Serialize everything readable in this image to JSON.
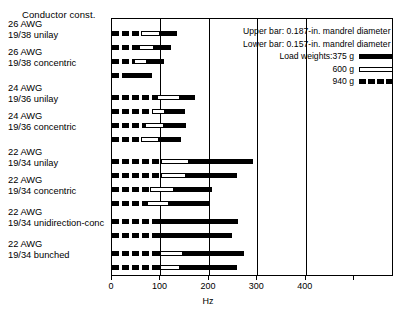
{
  "chart_data": {
    "type": "bar",
    "orientation": "horizontal",
    "stacked": true,
    "title": "",
    "xlabel": "Hz",
    "ylabel": "Conductor const.",
    "xlim": [
      0,
      582
    ],
    "xticks": [
      0,
      100,
      200,
      300,
      400
    ],
    "xticklabels": [
      "0",
      "100",
      "200",
      "300",
      "400"
    ],
    "grid": "vertical gridlines at 100, 200, 300, 400",
    "legend_position": "upper-right inside plot",
    "series": [
      {
        "name": "375 g",
        "style": "solid-black"
      },
      {
        "name": "600 g",
        "style": "hollow-white-outline"
      },
      {
        "name": "940 g",
        "style": "dashed-black"
      }
    ],
    "groups": [
      {
        "label_line1": "26 AWG",
        "label_line2": "19/38 unilay",
        "bars": [
          {
            "mandrel": "upper",
            "seg_940": 60,
            "seg_600": 100,
            "seg_375": 134,
            "total": 134
          },
          {
            "mandrel": "lower",
            "seg_940": 55,
            "seg_600": 88,
            "seg_375": 122,
            "total": 122
          }
        ]
      },
      {
        "label_line1": "26 AWG",
        "label_line2": "19/38 concentric",
        "bars": [
          {
            "mandrel": "upper",
            "seg_940": 46,
            "seg_600": 72,
            "seg_375": 107,
            "total": 107
          },
          {
            "mandrel": "lower",
            "seg_940": 26,
            "seg_600": 26,
            "seg_375": 82,
            "total": 82
          }
        ]
      },
      {
        "label_line1": "24 AWG",
        "label_line2": "19/36 unilay",
        "bars": [
          {
            "mandrel": "upper",
            "seg_940": 93,
            "seg_600": 140,
            "seg_375": 171,
            "total": 171
          },
          {
            "mandrel": "lower",
            "seg_940": 82,
            "seg_600": 110,
            "seg_375": 150,
            "total": 150
          }
        ]
      },
      {
        "label_line1": "24 AWG",
        "label_line2": "19/36 concentric",
        "bars": [
          {
            "mandrel": "upper",
            "seg_940": 68,
            "seg_600": 107,
            "seg_375": 153,
            "total": 153
          },
          {
            "mandrel": "lower",
            "seg_940": 60,
            "seg_600": 98,
            "seg_375": 142,
            "total": 142
          }
        ]
      },
      {
        "label_line1": "22 AWG",
        "label_line2": "19/34 unilay",
        "bars": [
          {
            "mandrel": "upper",
            "seg_940": 100,
            "seg_600": 160,
            "seg_375": 291,
            "total": 291
          },
          {
            "mandrel": "lower",
            "seg_940": 100,
            "seg_600": 152,
            "seg_375": 258,
            "total": 258
          }
        ]
      },
      {
        "label_line1": "22 AWG",
        "label_line2": "19/34 concentric",
        "bars": [
          {
            "mandrel": "upper",
            "seg_940": 78,
            "seg_600": 128,
            "seg_375": 206,
            "total": 206
          },
          {
            "mandrel": "lower",
            "seg_940": 72,
            "seg_600": 118,
            "seg_375": 200,
            "total": 200
          }
        ]
      },
      {
        "label_line1": "22 AWG",
        "label_line2": "19/34 unidirection-conc",
        "bars": [
          {
            "mandrel": "upper",
            "seg_940": 82,
            "seg_600": 82,
            "seg_375": 260,
            "total": 260
          },
          {
            "mandrel": "lower",
            "seg_940": 92,
            "seg_600": 92,
            "seg_375": 247,
            "total": 247
          }
        ]
      },
      {
        "label_line1": "22 AWG",
        "label_line2": "19/34 bunched",
        "bars": [
          {
            "mandrel": "upper",
            "seg_940": 98,
            "seg_600": 146,
            "seg_375": 272,
            "total": 272
          },
          {
            "mandrel": "lower",
            "seg_940": 98,
            "seg_600": 140,
            "seg_375": 258,
            "total": 258
          }
        ]
      }
    ]
  },
  "axis_title": "Conductor const.",
  "legend": {
    "line_upper": "Upper bar: 0.187-in. mandrel diameter",
    "line_lower": "Lower bar: 0.157-in. mandrel diameter",
    "load_prefix": "Load weights:375 g",
    "w600": "600 g",
    "w940": "940 g"
  },
  "xaxis": {
    "label": "Hz",
    "ticklabels": [
      "0",
      "100",
      "200",
      "300",
      "400"
    ]
  }
}
